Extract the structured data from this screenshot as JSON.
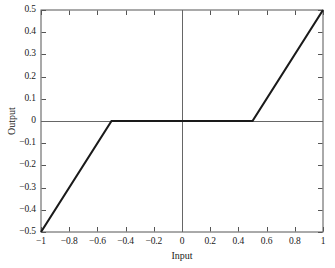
{
  "chart_data": {
    "type": "line",
    "title": "",
    "xlabel": "Input",
    "ylabel": "Output",
    "xlim": [
      -1,
      1
    ],
    "ylim": [
      -0.5,
      0.5
    ],
    "grid": false,
    "legend": null,
    "xticks": [
      -1,
      -0.8,
      -0.6,
      -0.4,
      -0.2,
      0,
      0.2,
      0.4,
      0.6,
      0.8,
      1
    ],
    "yticks": [
      -0.5,
      -0.4,
      -0.3,
      -0.2,
      -0.1,
      0,
      0.1,
      0.2,
      0.3,
      0.4,
      0.5
    ],
    "xtick_labels": [
      "−1",
      "−0.8",
      "−0.6",
      "−0.4",
      "−0.2",
      "0",
      "0.2",
      "0.4",
      "0.6",
      "0.8",
      "1"
    ],
    "ytick_labels": [
      "−0.5",
      "−0.4",
      "−0.3",
      "−0.2",
      "−0.1",
      "0",
      "0.1",
      "0.2",
      "0.3",
      "0.4",
      "0.5"
    ],
    "series": [
      {
        "name": "dead-zone",
        "x": [
          -1,
          -0.5,
          0.5,
          1
        ],
        "values": [
          -0.5,
          0,
          0,
          0.5
        ],
        "color": "#1a1a1a",
        "linewidth": 2.1
      }
    ],
    "annotations": {
      "zero_line_x": 0,
      "zero_line_y": 0,
      "breakpoints": [
        -0.5,
        0.5
      ]
    }
  },
  "axes": {
    "frame_color": "#555555",
    "zero_line_color": "#666666",
    "background": "#ffffff"
  }
}
